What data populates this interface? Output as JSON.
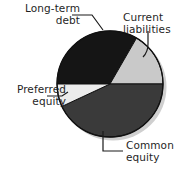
{
  "figure": {
    "background_color": "#ffffff"
  },
  "chart_data": {
    "type": "pie",
    "title": "",
    "xlabel": "",
    "ylabel": "",
    "legend_position": "callout-labels",
    "grid": false,
    "categories": [
      "Long-term debt",
      "Current liabilities",
      "Common equity",
      "Preferred equity"
    ],
    "values": [
      33,
      17,
      38,
      12
    ],
    "units": "percent",
    "colors": [
      "#151515",
      "#c9c9c9",
      "#3a3a3a",
      "#ececec"
    ],
    "slices": [
      {
        "label": "Long-term debt",
        "value": 33,
        "color": "#151515",
        "start_angle_deg": 60,
        "end_angle_deg": 180,
        "label_lines": [
          "Long-term",
          "debt"
        ],
        "label_position": "top-left"
      },
      {
        "label": "Current liabilities",
        "value": 17,
        "color": "#c9c9c9",
        "start_angle_deg": 0,
        "end_angle_deg": 60,
        "label_lines": [
          "Current",
          "liabilities"
        ],
        "label_position": "top-right"
      },
      {
        "label": "Common equity",
        "value": 38,
        "color": "#3a3a3a",
        "start_angle_deg": 205,
        "end_angle_deg": 360,
        "label_lines": [
          "Common",
          "equity"
        ],
        "label_position": "bottom-right"
      },
      {
        "label": "Preferred equity",
        "value": 12,
        "color": "#ececec",
        "start_angle_deg": 180,
        "end_angle_deg": 205,
        "label_lines": [
          "Preferred",
          "equity"
        ],
        "label_position": "left"
      }
    ],
    "geometry": {
      "center_x": 110,
      "center_y": 84,
      "radius": 53,
      "outline_color": "#111111",
      "shadow_color": "#cfcfcf"
    }
  },
  "labels": {
    "long_term_debt": {
      "line1": "Long-term",
      "line2": "debt"
    },
    "current_liabilities": {
      "line1": "Current",
      "line2": "liabilities"
    },
    "preferred_equity": {
      "line1": "Preferred",
      "line2": "equity"
    },
    "common_equity": {
      "line1": "Common",
      "line2": "equity"
    }
  }
}
